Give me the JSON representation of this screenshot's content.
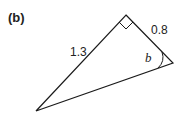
{
  "figure": {
    "part_label": "(b)",
    "triangle": {
      "hypotenuse_label": "1.3",
      "short_side_label": "0.8",
      "angle_label": "b",
      "right_angle_marker": true
    }
  }
}
